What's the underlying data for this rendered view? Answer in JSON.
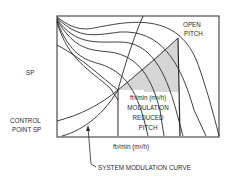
{
  "diagram": {
    "y_axis_label": "SP",
    "x_axis_label": "ft³/min (m³/h)",
    "top_right_label": [
      "OPEN",
      "PITCH"
    ],
    "left_label": [
      "CONTROL",
      "POINT SP"
    ],
    "shaded_region_label": [
      "ft³/min (m³/h)",
      "MODULATION",
      "REDUCED",
      "PITCH"
    ],
    "callout_label": "SYSTEM MODULATION CURVE",
    "colors": {
      "line": "#2a2a2a",
      "shade": "#d6d6d6",
      "background": "#ffffff"
    }
  }
}
